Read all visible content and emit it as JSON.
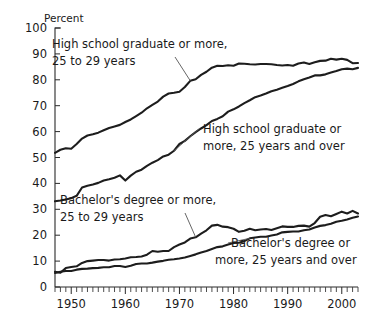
{
  "chart_data": {
    "type": "line",
    "title": "",
    "subtitle": "",
    "xlabel": "",
    "ylabel": "Percent",
    "ylim": [
      0,
      100
    ],
    "xlim": [
      1947,
      2003
    ],
    "grid": false,
    "legend_position": "inline-annotations",
    "ytick_labels": [
      "0",
      "10",
      "20",
      "30",
      "40",
      "50",
      "60",
      "70",
      "80",
      "90",
      "100"
    ],
    "yticks": [
      0,
      10,
      20,
      30,
      40,
      50,
      60,
      70,
      80,
      90,
      100
    ],
    "xtick_labels": [
      "1950",
      "1960",
      "1970",
      "1980",
      "1990",
      "2000"
    ],
    "xticks": [
      1950,
      1960,
      1970,
      1980,
      1990,
      2000
    ],
    "minor_xtick_interval": 1,
    "annotations": [
      {
        "id": "hs-25-29",
        "text_line1": "High school graduate or more,",
        "text_line2": "25 to 29 years",
        "points_to_year": 1972
      },
      {
        "id": "hs-25-over",
        "text_line1": "High school graduate or",
        "text_line2": "more, 25 years and over",
        "points_to_year": 1969
      },
      {
        "id": "ba-25-29",
        "text_line1": "Bachelor's degree or more,",
        "text_line2": "25 to 29 years",
        "points_to_year": 1973
      },
      {
        "id": "ba-25-over",
        "text_line1": "Bachelor's degree or",
        "text_line2": "more, 25 years and over",
        "points_to_year": 1983
      }
    ],
    "x": [
      1947,
      1948,
      1949,
      1950,
      1951,
      1952,
      1953,
      1954,
      1955,
      1956,
      1957,
      1958,
      1959,
      1960,
      1961,
      1962,
      1963,
      1964,
      1965,
      1966,
      1967,
      1968,
      1969,
      1970,
      1971,
      1972,
      1973,
      1974,
      1975,
      1976,
      1977,
      1978,
      1979,
      1980,
      1981,
      1982,
      1983,
      1984,
      1985,
      1986,
      1987,
      1988,
      1989,
      1990,
      1991,
      1992,
      1993,
      1994,
      1995,
      1996,
      1997,
      1998,
      1999,
      2000,
      2001,
      2002,
      2003
    ],
    "series": [
      {
        "name": "High school graduate or more, 25 to 29 years",
        "values": [
          51.8,
          53.0,
          53.6,
          53.4,
          55.2,
          57.3,
          58.5,
          59.0,
          59.6,
          60.5,
          61.4,
          62.0,
          62.6,
          63.7,
          64.7,
          66.0,
          67.3,
          69.0,
          70.3,
          71.6,
          73.5,
          74.7,
          75.0,
          75.4,
          77.2,
          79.6,
          80.2,
          81.9,
          83.1,
          84.7,
          85.4,
          85.3,
          85.6,
          85.4,
          86.3,
          86.2,
          86.0,
          85.9,
          86.1,
          86.1,
          86.0,
          85.7,
          85.5,
          85.7,
          85.4,
          86.3,
          86.7,
          86.1,
          86.8,
          87.3,
          87.4,
          88.1,
          87.8,
          88.1,
          87.7,
          86.4,
          86.5
        ]
      },
      {
        "name": "High school graduate or more, 25 years and over",
        "values": [
          33.1,
          33.4,
          33.8,
          34.3,
          35.2,
          38.4,
          39.1,
          39.6,
          40.2,
          41.1,
          41.6,
          42.2,
          43.1,
          41.1,
          43.0,
          44.5,
          45.3,
          46.8,
          48.0,
          49.0,
          50.4,
          51.1,
          52.6,
          55.2,
          56.4,
          58.2,
          59.8,
          61.2,
          62.5,
          64.1,
          64.9,
          65.9,
          67.7,
          68.6,
          69.7,
          71.0,
          72.1,
          73.3,
          73.9,
          74.7,
          75.6,
          76.2,
          76.9,
          77.6,
          78.4,
          79.4,
          80.2,
          80.9,
          81.7,
          81.7,
          82.1,
          82.8,
          83.4,
          84.1,
          84.3,
          84.1,
          84.6
        ]
      },
      {
        "name": "Bachelor's degree or more, 25 to 29 years",
        "values": [
          5.9,
          5.5,
          7.3,
          7.7,
          8.0,
          9.3,
          10.0,
          10.2,
          10.4,
          10.4,
          10.2,
          10.6,
          10.7,
          11.0,
          11.5,
          11.6,
          11.8,
          12.5,
          13.9,
          13.6,
          13.9,
          13.9,
          15.4,
          16.4,
          17.2,
          18.7,
          19.2,
          20.6,
          21.9,
          23.7,
          24.0,
          23.3,
          23.1,
          22.5,
          21.3,
          21.7,
          22.5,
          21.9,
          22.2,
          22.4,
          22.0,
          22.7,
          23.4,
          23.2,
          23.2,
          23.6,
          23.7,
          23.3,
          24.7,
          27.1,
          27.8,
          27.3,
          28.2,
          29.1,
          28.4,
          29.4,
          28.4
        ]
      },
      {
        "name": "Bachelor's degree or more, 25 years and over",
        "values": [
          5.4,
          5.9,
          6.2,
          6.2,
          6.7,
          7.0,
          7.1,
          7.3,
          7.4,
          7.6,
          7.6,
          8.1,
          8.1,
          7.7,
          8.2,
          8.9,
          9.1,
          9.1,
          9.4,
          9.8,
          10.1,
          10.5,
          10.7,
          11.0,
          11.4,
          12.0,
          12.6,
          13.3,
          13.9,
          14.7,
          15.4,
          15.7,
          16.4,
          17.0,
          17.1,
          17.7,
          18.8,
          19.1,
          19.4,
          19.4,
          19.9,
          20.3,
          21.1,
          21.3,
          21.4,
          21.4,
          21.9,
          22.2,
          23.0,
          23.6,
          23.9,
          24.4,
          25.2,
          25.6,
          26.1,
          26.7,
          27.2
        ]
      }
    ]
  },
  "axis": {
    "y_unit_label": "Percent"
  }
}
